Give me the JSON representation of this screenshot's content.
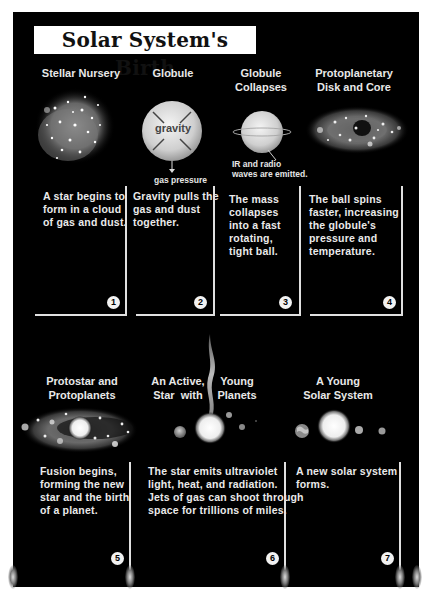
{
  "title": "Solar System's Birth",
  "stages": [
    {
      "number": "1",
      "heading": "Stellar Nursery",
      "description": "A star begins to form in a cloud of gas and dust."
    },
    {
      "number": "2",
      "heading": "Globule",
      "description": "Gravity pulls the gas and dust together."
    },
    {
      "number": "3",
      "heading": "Globule Collapses",
      "description": "The mass collapses into a fast rotating, tight ball."
    },
    {
      "number": "4",
      "heading": "Protoplanetary Disk and Core",
      "description": "The ball spins faster, increasing the globule's pressure and temperature."
    },
    {
      "number": "5",
      "heading": "Protostar and Protoplanets",
      "description": "Fusion begins, forming the new star and the birth of a planet."
    },
    {
      "number": "6",
      "heading": "An Active, Young Star with Planets",
      "description": "The star emits ultraviolet light, heat, and radiation. Jets of gas can shoot through space for trillions of miles."
    },
    {
      "number": "7",
      "heading": "A Young Solar System",
      "description": "A new solar system forms."
    }
  ],
  "labels": {
    "gravity": "gravity",
    "gas_pressure": "gas pressure",
    "ir_radio_line1": "IR and radio",
    "ir_radio_line2": "waves are emitted."
  },
  "headings_split": {
    "s1": [
      "Stellar Nursery"
    ],
    "s2": [
      "Globule"
    ],
    "s3": [
      "Globule",
      "Collapses"
    ],
    "s4": [
      "Protoplanetary",
      "Disk and Core"
    ],
    "s5": [
      "Protostar and",
      "Protoplanets"
    ],
    "s6_left": [
      "An Active,",
      "Star  with"
    ],
    "s6_right": [
      "Young",
      "Planets"
    ],
    "s7": [
      "A Young",
      "Solar System"
    ]
  },
  "desc_lines": {
    "s1": [
      "A star begins to",
      "form in a cloud",
      "of gas and dust."
    ],
    "s2": [
      "Gravity pulls the",
      "gas and dust",
      "together."
    ],
    "s3": [
      "The mass",
      "collapses",
      "into a fast",
      "rotating,",
      "tight ball."
    ],
    "s4": [
      "The ball spins",
      "faster, increasing",
      "the globule's",
      "pressure and",
      "temperature."
    ],
    "s5": [
      "Fusion begins,",
      "forming the new",
      "star and the birth",
      "of a planet."
    ],
    "s6": [
      "The star emits ultraviolet",
      "light, heat, and radiation.",
      "Jets of gas can shoot through",
      "space for trillions of miles."
    ],
    "s7": [
      "A new solar system",
      "forms."
    ]
  },
  "colors": {
    "background": "#000000",
    "page": "#ffffff",
    "text": "#eaeaea",
    "line": "#e0e0e0"
  }
}
